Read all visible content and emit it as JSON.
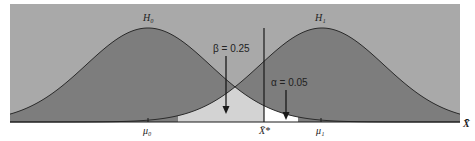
{
  "chart_data": {
    "type": "area",
    "title": "",
    "xlabel": "X̄",
    "ylabel": "",
    "grid": false,
    "legend": null,
    "series": [
      {
        "name": "H₀",
        "center_label": "μ₀",
        "distribution": "normal",
        "mean_px": 148,
        "sd_px": 62
      },
      {
        "name": "H₁",
        "center_label": "μ₁",
        "distribution": "normal",
        "mean_px": 322,
        "sd_px": 62
      }
    ],
    "critical_value_label": "X̄*",
    "annotations": [
      {
        "text": "β = 0.25",
        "region": "type II error: H₁ area left of X̄*"
      },
      {
        "text": "α = 0.05",
        "region": "type I error: H₀ area right of X̄*"
      }
    ],
    "tick_labels": [
      "μ₀",
      "X̄*",
      "μ₁"
    ],
    "colors": {
      "background": "#a9a9a9",
      "curve_fill": "#7d7d7d",
      "beta_fill": "#d3d3d3",
      "alpha_fill": "#ffffff",
      "line": "#2a2a2a"
    }
  },
  "labels": {
    "h0": "H₀",
    "h1": "H₁",
    "beta": "β = 0.25",
    "alpha": "α = 0.05",
    "mu0": "μ₀",
    "mu1": "μ₁",
    "xstar": "X̄*",
    "xaxis": "X̄"
  }
}
